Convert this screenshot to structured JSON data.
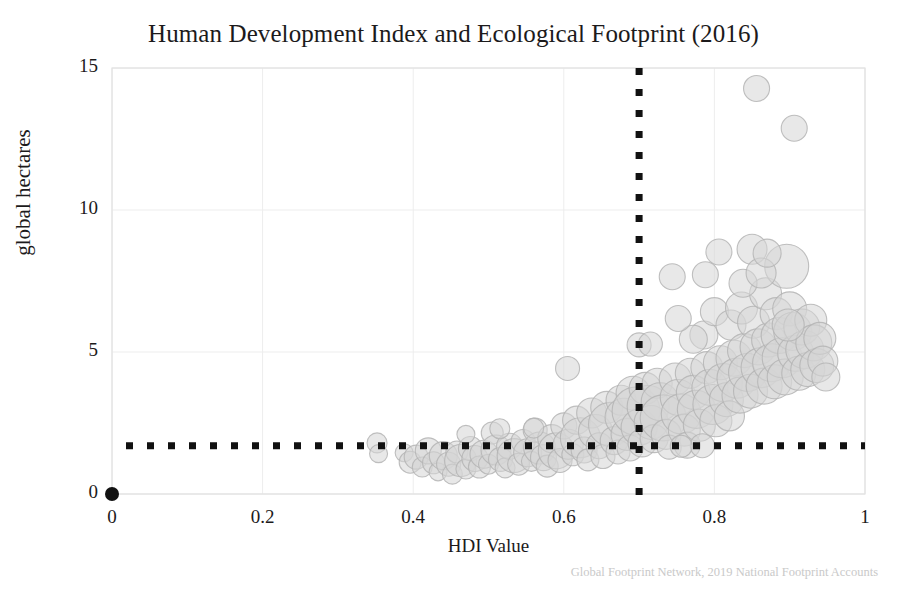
{
  "chart_data": {
    "type": "scatter",
    "title": "Human Development Index and Ecological Footprint (2016)",
    "xlabel": "HDI Value",
    "ylabel": "global hectares",
    "attribution": "Global Footprint Network, 2019 National Footprint Accounts",
    "xlim": [
      0,
      1
    ],
    "ylim": [
      0,
      15
    ],
    "xticks": [
      "0",
      "0.2",
      "0.4",
      "0.6",
      "0.8",
      "1"
    ],
    "xtick_values": [
      0,
      0.2,
      0.4,
      0.6,
      0.8,
      1
    ],
    "yticks": [
      "0",
      "5",
      "10",
      "15"
    ],
    "ytick_values": [
      0,
      5,
      10,
      15
    ],
    "grid": true,
    "legend": "none",
    "marker": {
      "shape": "circle",
      "fill": "#d6d6d6",
      "stroke": "#b4b4b4",
      "opacity": 0.55,
      "size_encodes": "population"
    },
    "reference_lines": [
      {
        "name": "hdi-threshold",
        "orientation": "vertical",
        "value": 0.7,
        "style": "dotted",
        "color": "#111111"
      },
      {
        "name": "biocapacity-threshold",
        "orientation": "horizontal",
        "value": 1.7,
        "style": "dotted",
        "color": "#111111"
      }
    ],
    "origin_marker": {
      "x": 0,
      "y": 0,
      "color": "#111111",
      "radius": 7
    },
    "points": [
      {
        "x": 0.352,
        "y": 1.8,
        "r": 10
      },
      {
        "x": 0.354,
        "y": 1.42,
        "r": 9
      },
      {
        "x": 0.388,
        "y": 1.45,
        "r": 9
      },
      {
        "x": 0.396,
        "y": 1.12,
        "r": 11
      },
      {
        "x": 0.404,
        "y": 1.3,
        "r": 12
      },
      {
        "x": 0.412,
        "y": 0.95,
        "r": 10
      },
      {
        "x": 0.42,
        "y": 1.52,
        "r": 13
      },
      {
        "x": 0.427,
        "y": 1.1,
        "r": 11
      },
      {
        "x": 0.433,
        "y": 0.78,
        "r": 9
      },
      {
        "x": 0.44,
        "y": 1.35,
        "r": 14
      },
      {
        "x": 0.447,
        "y": 1.05,
        "r": 12
      },
      {
        "x": 0.452,
        "y": 0.7,
        "r": 10
      },
      {
        "x": 0.458,
        "y": 1.48,
        "r": 11
      },
      {
        "x": 0.463,
        "y": 1.18,
        "r": 16
      },
      {
        "x": 0.47,
        "y": 0.88,
        "r": 10
      },
      {
        "x": 0.476,
        "y": 1.6,
        "r": 12
      },
      {
        "x": 0.482,
        "y": 1.25,
        "r": 13
      },
      {
        "x": 0.488,
        "y": 0.95,
        "r": 11
      },
      {
        "x": 0.494,
        "y": 1.4,
        "r": 14
      },
      {
        "x": 0.5,
        "y": 1.05,
        "r": 10
      },
      {
        "x": 0.505,
        "y": 2.15,
        "r": 11
      },
      {
        "x": 0.51,
        "y": 1.55,
        "r": 15
      },
      {
        "x": 0.516,
        "y": 1.22,
        "r": 12
      },
      {
        "x": 0.522,
        "y": 0.92,
        "r": 10
      },
      {
        "x": 0.528,
        "y": 1.68,
        "r": 13
      },
      {
        "x": 0.534,
        "y": 1.35,
        "r": 17
      },
      {
        "x": 0.54,
        "y": 1.05,
        "r": 11
      },
      {
        "x": 0.546,
        "y": 1.85,
        "r": 12
      },
      {
        "x": 0.552,
        "y": 1.45,
        "r": 14
      },
      {
        "x": 0.557,
        "y": 1.15,
        "r": 10
      },
      {
        "x": 0.562,
        "y": 2.25,
        "r": 12
      },
      {
        "x": 0.568,
        "y": 1.62,
        "r": 16
      },
      {
        "x": 0.573,
        "y": 1.28,
        "r": 13
      },
      {
        "x": 0.578,
        "y": 0.98,
        "r": 11
      },
      {
        "x": 0.584,
        "y": 1.95,
        "r": 14
      },
      {
        "x": 0.59,
        "y": 1.52,
        "r": 18
      },
      {
        "x": 0.595,
        "y": 1.18,
        "r": 12
      },
      {
        "x": 0.6,
        "y": 2.4,
        "r": 13
      },
      {
        "x": 0.605,
        "y": 4.42,
        "r": 12
      },
      {
        "x": 0.606,
        "y": 1.75,
        "r": 15
      },
      {
        "x": 0.612,
        "y": 1.38,
        "r": 11
      },
      {
        "x": 0.617,
        "y": 2.6,
        "r": 14
      },
      {
        "x": 0.622,
        "y": 1.98,
        "r": 20
      },
      {
        "x": 0.627,
        "y": 1.55,
        "r": 13
      },
      {
        "x": 0.632,
        "y": 1.2,
        "r": 11
      },
      {
        "x": 0.637,
        "y": 2.85,
        "r": 15
      },
      {
        "x": 0.642,
        "y": 2.2,
        "r": 17
      },
      {
        "x": 0.647,
        "y": 1.7,
        "r": 13
      },
      {
        "x": 0.652,
        "y": 1.32,
        "r": 12
      },
      {
        "x": 0.657,
        "y": 3.05,
        "r": 16
      },
      {
        "x": 0.662,
        "y": 2.45,
        "r": 22
      },
      {
        "x": 0.667,
        "y": 1.88,
        "r": 14
      },
      {
        "x": 0.672,
        "y": 1.48,
        "r": 12
      },
      {
        "x": 0.676,
        "y": 3.3,
        "r": 15
      },
      {
        "x": 0.68,
        "y": 2.7,
        "r": 19
      },
      {
        "x": 0.684,
        "y": 2.1,
        "r": 16
      },
      {
        "x": 0.688,
        "y": 1.62,
        "r": 13
      },
      {
        "x": 0.692,
        "y": 3.55,
        "r": 17
      },
      {
        "x": 0.696,
        "y": 2.92,
        "r": 24
      },
      {
        "x": 0.7,
        "y": 5.25,
        "r": 12
      },
      {
        "x": 0.7,
        "y": 2.35,
        "r": 18
      },
      {
        "x": 0.704,
        "y": 1.8,
        "r": 14
      },
      {
        "x": 0.708,
        "y": 3.72,
        "r": 16
      },
      {
        "x": 0.712,
        "y": 3.08,
        "r": 21
      },
      {
        "x": 0.716,
        "y": 2.52,
        "r": 17
      },
      {
        "x": 0.72,
        "y": 1.95,
        "r": 14
      },
      {
        "x": 0.724,
        "y": 3.9,
        "r": 15
      },
      {
        "x": 0.728,
        "y": 3.25,
        "r": 19
      },
      {
        "x": 0.732,
        "y": 2.68,
        "r": 23
      },
      {
        "x": 0.736,
        "y": 2.1,
        "r": 15
      },
      {
        "x": 0.74,
        "y": 1.65,
        "r": 12
      },
      {
        "x": 0.744,
        "y": 7.65,
        "r": 13
      },
      {
        "x": 0.748,
        "y": 4.05,
        "r": 16
      },
      {
        "x": 0.752,
        "y": 3.4,
        "r": 18
      },
      {
        "x": 0.756,
        "y": 2.82,
        "r": 20
      },
      {
        "x": 0.76,
        "y": 2.25,
        "r": 16
      },
      {
        "x": 0.764,
        "y": 1.72,
        "r": 13
      },
      {
        "x": 0.768,
        "y": 4.25,
        "r": 15
      },
      {
        "x": 0.772,
        "y": 3.58,
        "r": 17
      },
      {
        "x": 0.776,
        "y": 2.98,
        "r": 19
      },
      {
        "x": 0.78,
        "y": 2.42,
        "r": 16
      },
      {
        "x": 0.784,
        "y": 1.7,
        "r": 12
      },
      {
        "x": 0.786,
        "y": 5.6,
        "r": 14
      },
      {
        "x": 0.79,
        "y": 4.45,
        "r": 16
      },
      {
        "x": 0.794,
        "y": 3.75,
        "r": 18
      },
      {
        "x": 0.798,
        "y": 3.15,
        "r": 20
      },
      {
        "x": 0.8,
        "y": 6.42,
        "r": 14
      },
      {
        "x": 0.802,
        "y": 2.58,
        "r": 16
      },
      {
        "x": 0.806,
        "y": 8.52,
        "r": 13
      },
      {
        "x": 0.808,
        "y": 4.62,
        "r": 17
      },
      {
        "x": 0.812,
        "y": 3.92,
        "r": 19
      },
      {
        "x": 0.816,
        "y": 3.32,
        "r": 17
      },
      {
        "x": 0.82,
        "y": 2.75,
        "r": 15
      },
      {
        "x": 0.822,
        "y": 5.95,
        "r": 15
      },
      {
        "x": 0.826,
        "y": 4.78,
        "r": 18
      },
      {
        "x": 0.83,
        "y": 4.08,
        "r": 20
      },
      {
        "x": 0.834,
        "y": 3.48,
        "r": 18
      },
      {
        "x": 0.836,
        "y": 6.55,
        "r": 16
      },
      {
        "x": 0.84,
        "y": 5.05,
        "r": 17
      },
      {
        "x": 0.844,
        "y": 4.28,
        "r": 19
      },
      {
        "x": 0.848,
        "y": 3.62,
        "r": 17
      },
      {
        "x": 0.85,
        "y": 8.62,
        "r": 15
      },
      {
        "x": 0.852,
        "y": 6.05,
        "r": 16
      },
      {
        "x": 0.856,
        "y": 14.28,
        "r": 13
      },
      {
        "x": 0.858,
        "y": 5.18,
        "r": 18
      },
      {
        "x": 0.862,
        "y": 4.45,
        "r": 20
      },
      {
        "x": 0.866,
        "y": 3.8,
        "r": 18
      },
      {
        "x": 0.868,
        "y": 7.05,
        "r": 16
      },
      {
        "x": 0.872,
        "y": 5.42,
        "r": 17
      },
      {
        "x": 0.876,
        "y": 4.62,
        "r": 19
      },
      {
        "x": 0.88,
        "y": 3.95,
        "r": 17
      },
      {
        "x": 0.882,
        "y": 6.35,
        "r": 16
      },
      {
        "x": 0.886,
        "y": 5.58,
        "r": 18
      },
      {
        "x": 0.89,
        "y": 4.8,
        "r": 20
      },
      {
        "x": 0.894,
        "y": 4.12,
        "r": 18
      },
      {
        "x": 0.896,
        "y": 8.02,
        "r": 22
      },
      {
        "x": 0.9,
        "y": 6.52,
        "r": 17
      },
      {
        "x": 0.904,
        "y": 5.72,
        "r": 19
      },
      {
        "x": 0.906,
        "y": 12.88,
        "r": 13
      },
      {
        "x": 0.908,
        "y": 4.95,
        "r": 18
      },
      {
        "x": 0.912,
        "y": 4.25,
        "r": 17
      },
      {
        "x": 0.916,
        "y": 5.88,
        "r": 18
      },
      {
        "x": 0.92,
        "y": 5.08,
        "r": 19
      },
      {
        "x": 0.924,
        "y": 4.38,
        "r": 17
      },
      {
        "x": 0.928,
        "y": 6.12,
        "r": 16
      },
      {
        "x": 0.932,
        "y": 5.32,
        "r": 18
      },
      {
        "x": 0.936,
        "y": 4.52,
        "r": 17
      },
      {
        "x": 0.94,
        "y": 5.48,
        "r": 16
      },
      {
        "x": 0.944,
        "y": 4.68,
        "r": 15
      },
      {
        "x": 0.948,
        "y": 4.12,
        "r": 14
      },
      {
        "x": 0.715,
        "y": 5.28,
        "r": 12
      },
      {
        "x": 0.756,
        "y": 1.68,
        "r": 11
      },
      {
        "x": 0.515,
        "y": 2.3,
        "r": 10
      },
      {
        "x": 0.56,
        "y": 2.32,
        "r": 10
      },
      {
        "x": 0.47,
        "y": 2.1,
        "r": 9
      },
      {
        "x": 0.838,
        "y": 7.42,
        "r": 14
      },
      {
        "x": 0.862,
        "y": 7.78,
        "r": 15
      },
      {
        "x": 0.788,
        "y": 7.72,
        "r": 13
      },
      {
        "x": 0.87,
        "y": 8.48,
        "r": 14
      },
      {
        "x": 0.898,
        "y": 5.95,
        "r": 16
      },
      {
        "x": 0.772,
        "y": 5.45,
        "r": 14
      },
      {
        "x": 0.752,
        "y": 6.18,
        "r": 13
      }
    ]
  }
}
